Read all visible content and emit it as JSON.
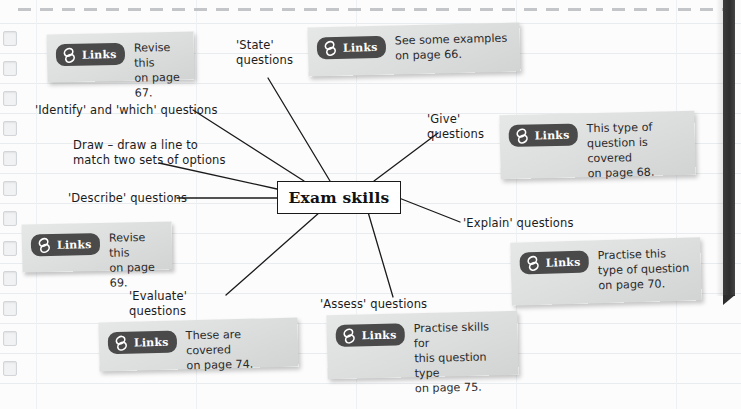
{
  "page": {
    "paper_color": "#fcfcfc",
    "rule_color": "#e9ecee",
    "spine_color": "#2e2e2e",
    "perforation_color": "#b9bcbf"
  },
  "centre": {
    "title": "Exam skills"
  },
  "branch_labels": [
    {
      "id": "state",
      "text": "'State'\nquestions"
    },
    {
      "id": "identify",
      "text": "'Identify' and 'which' questions"
    },
    {
      "id": "draw",
      "text": "Draw – draw a line to\nmatch two sets of options"
    },
    {
      "id": "describe",
      "text": "'Describe' questions"
    },
    {
      "id": "give",
      "text": "'Give'\nquestions"
    },
    {
      "id": "explain",
      "text": "'Explain' questions"
    },
    {
      "id": "evaluate",
      "text": "'Evaluate'\nquestions"
    },
    {
      "id": "assess",
      "text": "'Assess' questions"
    }
  ],
  "link_cards": [
    {
      "id": "card-67",
      "badge": "Links",
      "icon": "chain-link-icon",
      "body": "Revise this\non page 67."
    },
    {
      "id": "card-66",
      "badge": "Links",
      "icon": "chain-link-icon",
      "body": "See some examples\non page 66."
    },
    {
      "id": "card-68",
      "badge": "Links",
      "icon": "chain-link-icon",
      "body": "This type of\nquestion is covered\non page 68."
    },
    {
      "id": "card-69",
      "badge": "Links",
      "icon": "chain-link-icon",
      "body": "Revise this\non page 69."
    },
    {
      "id": "card-70",
      "badge": "Links",
      "icon": "chain-link-icon",
      "body": "Practise this\ntype of question\non page 70."
    },
    {
      "id": "card-74",
      "badge": "Links",
      "icon": "chain-link-icon",
      "body": "These are covered\non page 74."
    },
    {
      "id": "card-75",
      "badge": "Links",
      "icon": "chain-link-icon",
      "body": "Practise skills for\nthis question type\non page 75."
    }
  ]
}
